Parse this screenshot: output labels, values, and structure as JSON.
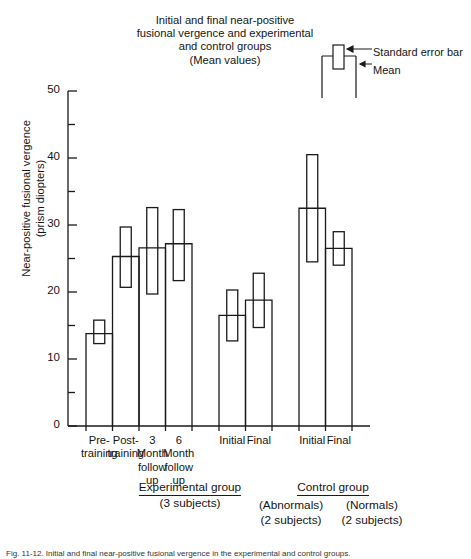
{
  "title": {
    "lines": [
      "Initial and final near-positive",
      "fusional vergence and experimental",
      "and control groups",
      "(Mean values)"
    ]
  },
  "legend": {
    "error_bar_label": "Standard error bar",
    "mean_label": "Mean"
  },
  "axis": {
    "y_title_line1": "Near-positive fusional vergence",
    "y_title_line2": "(prism diopters)"
  },
  "groups": {
    "experimental": {
      "name": "Experimental group",
      "subjects": "(3 subjects)"
    },
    "control": {
      "name": "Control group",
      "sub1_name": "(Abnormals)",
      "sub1_subjects": "(2 subjects)",
      "sub2_name": "(Normals)",
      "sub2_subjects": "(2 subjects)"
    }
  },
  "chart_data": {
    "type": "bar",
    "title": "Initial and final near-positive fusional vergence and experimental and control groups (Mean values)",
    "xlabel": "",
    "ylabel": "Near-positive fusional vergence (prism diopters)",
    "ylim": [
      0,
      50
    ],
    "ytick_labels": [
      "0",
      "10",
      "20",
      "30",
      "40",
      "50"
    ],
    "ytick_values": [
      0,
      10,
      20,
      30,
      40,
      50
    ],
    "minor_tick_values": [
      5,
      15,
      25,
      35,
      45
    ],
    "grid": false,
    "legend_position": "top-right",
    "categories": [
      "Pre-training",
      "Post-training",
      "3 Month follow up",
      "6 Month follow up",
      "Initial",
      "Final",
      "Initial",
      "Final"
    ],
    "category_label_lines": [
      [
        "Pre-",
        "training"
      ],
      [
        "Post-",
        "training"
      ],
      [
        "3",
        "Month",
        "follow",
        "up"
      ],
      [
        "6",
        "Month",
        "follow",
        "up"
      ],
      [
        "Initial"
      ],
      [
        "Final"
      ],
      [
        "Initial"
      ],
      [
        "Final"
      ]
    ],
    "values": [
      13.8,
      25.3,
      26.6,
      27.2,
      16.5,
      18.8,
      32.5,
      26.5
    ],
    "error_low": [
      12.3,
      20.7,
      19.7,
      21.7,
      12.7,
      14.7,
      24.5,
      24.0
    ],
    "error_high": [
      15.8,
      29.7,
      32.6,
      32.3,
      20.3,
      22.8,
      40.5,
      29.0
    ],
    "group_of_bar": [
      "experimental",
      "experimental",
      "experimental",
      "experimental",
      "control-abnormals",
      "control-abnormals",
      "control-normals",
      "control-normals"
    ]
  },
  "caption": "Fig. 11-12.  Initial and final near-positive fusional vergence in the experimental and control groups."
}
